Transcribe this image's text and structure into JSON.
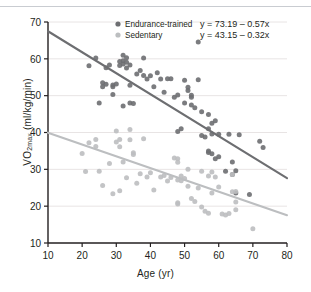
{
  "chart_data": {
    "type": "scatter",
    "title": "",
    "xlabel": "Age (yr)",
    "ylabel": "VO2max (ml/kg/min)",
    "ylabel_main": "VO",
    "ylabel_sub": "2max",
    "ylabel_units": " (ml/kg/min)",
    "xlim": [
      10,
      80
    ],
    "ylim": [
      10,
      70
    ],
    "xticks": [
      10,
      20,
      30,
      40,
      50,
      60,
      70,
      80
    ],
    "yticks": [
      10,
      20,
      30,
      40,
      50,
      60,
      70
    ],
    "grid": "horizontal",
    "legend_position": "top-center",
    "colors": {
      "endurance": "#6d6e71",
      "sedentary": "#bcbec0",
      "axis": "#231f20",
      "grid": "#e8e4e4",
      "top_rule": "#c9ccd1"
    },
    "series": [
      {
        "name": "Endurance-trained",
        "color": "#6d6e71",
        "equation": "y = 73.19 – 0.57x",
        "fit_intercept": 73.19,
        "fit_slope": -0.57,
        "points": [
          [
            22,
            58.1
          ],
          [
            24,
            60.2
          ],
          [
            25,
            48.0
          ],
          [
            26,
            52.4
          ],
          [
            26,
            53.5
          ],
          [
            27,
            53.1
          ],
          [
            27,
            57.6
          ],
          [
            28,
            58.3
          ],
          [
            29,
            50.3
          ],
          [
            29,
            52.4
          ],
          [
            29,
            52.9
          ],
          [
            30,
            53.2
          ],
          [
            31,
            59.3
          ],
          [
            31,
            58.2
          ],
          [
            32,
            61.0
          ],
          [
            32,
            59.5
          ],
          [
            32,
            58.6
          ],
          [
            32,
            47.2
          ],
          [
            33,
            57.5
          ],
          [
            33,
            60.3
          ],
          [
            33,
            59.1
          ],
          [
            34,
            58.3
          ],
          [
            34,
            52.8
          ],
          [
            34,
            48.0
          ],
          [
            35,
            47.9
          ],
          [
            36,
            55.9
          ],
          [
            37,
            56.8
          ],
          [
            38,
            60.2
          ],
          [
            38,
            55.5
          ],
          [
            39,
            54.5
          ],
          [
            40,
            55.4
          ],
          [
            41,
            52.4
          ],
          [
            42,
            56.2
          ],
          [
            43,
            54.5
          ],
          [
            44,
            50.9
          ],
          [
            45,
            54.6
          ],
          [
            46,
            54.6
          ],
          [
            47,
            49.6
          ],
          [
            48,
            50.2
          ],
          [
            48,
            40.3
          ],
          [
            49,
            41.0
          ],
          [
            50,
            54.2
          ],
          [
            50,
            48.0
          ],
          [
            51,
            51.4
          ],
          [
            51,
            52.3
          ],
          [
            52,
            49.6
          ],
          [
            52,
            50.1
          ],
          [
            52,
            47.5
          ],
          [
            53,
            46.7
          ],
          [
            54,
            64.6
          ],
          [
            54,
            54.3
          ],
          [
            55,
            45.6
          ],
          [
            55,
            39.2
          ],
          [
            56,
            38.8
          ],
          [
            57,
            44.9
          ],
          [
            57,
            41.0
          ],
          [
            57,
            34.6
          ],
          [
            57,
            35.0
          ],
          [
            58,
            42.5
          ],
          [
            58,
            34.2
          ],
          [
            58,
            39.6
          ],
          [
            59,
            43.2
          ],
          [
            59,
            32.9
          ],
          [
            60,
            39.5
          ],
          [
            60,
            33.4
          ],
          [
            62,
            29.5
          ],
          [
            63,
            39.5
          ],
          [
            64,
            28.6
          ],
          [
            64,
            32.0
          ],
          [
            65,
            29.6
          ],
          [
            65,
            23.6
          ],
          [
            66,
            39.4
          ],
          [
            69,
            23.2
          ],
          [
            72,
            37.6
          ],
          [
            73,
            35.9
          ]
        ]
      },
      {
        "name": "Sedentary",
        "color": "#bcbec0",
        "equation": "y = 43.15 – 0.32x",
        "fit_intercept": 43.15,
        "fit_slope": -0.32,
        "points": [
          [
            20,
            34.3
          ],
          [
            21,
            29.4
          ],
          [
            22,
            37.2
          ],
          [
            24,
            38.1
          ],
          [
            24,
            36.2
          ],
          [
            25,
            29.5
          ],
          [
            26,
            25.6
          ],
          [
            28,
            31.6
          ],
          [
            29,
            23.4
          ],
          [
            30,
            40.4
          ],
          [
            30,
            37.4
          ],
          [
            31,
            38.1
          ],
          [
            31,
            36.1
          ],
          [
            31,
            24.2
          ],
          [
            32,
            32.0
          ],
          [
            33,
            27.7
          ],
          [
            34,
            38.0
          ],
          [
            34,
            40.8
          ],
          [
            35,
            34.5
          ],
          [
            35,
            34.0
          ],
          [
            36,
            26.2
          ],
          [
            37,
            28.8
          ],
          [
            38,
            38.3
          ],
          [
            39,
            27.9
          ],
          [
            40,
            29.1
          ],
          [
            41,
            24.4
          ],
          [
            43,
            27.9
          ],
          [
            44,
            28.3
          ],
          [
            45,
            26.8
          ],
          [
            46,
            27.8
          ],
          [
            47,
            33.1
          ],
          [
            48,
            32.9
          ],
          [
            48,
            31.9
          ],
          [
            48,
            27.1
          ],
          [
            48,
            20.9
          ],
          [
            48,
            20.6
          ],
          [
            49,
            28.2
          ],
          [
            49,
            26.9
          ],
          [
            50,
            27.5
          ],
          [
            51,
            30.0
          ],
          [
            51,
            25.4
          ],
          [
            52,
            22.1
          ],
          [
            53,
            21.3
          ],
          [
            54,
            24.9
          ],
          [
            55,
            29.5
          ],
          [
            55,
            19.8
          ],
          [
            56,
            18.6
          ],
          [
            57,
            28.2
          ],
          [
            57,
            18.1
          ],
          [
            58,
            23.6
          ],
          [
            58,
            29.3
          ],
          [
            59,
            27.9
          ],
          [
            60,
            25.2
          ],
          [
            61,
            17.9
          ],
          [
            62,
            17.6
          ],
          [
            63,
            18.0
          ],
          [
            64,
            28.6
          ],
          [
            64,
            23.9
          ],
          [
            65,
            21.1
          ],
          [
            65,
            19.0
          ],
          [
            65,
            24.0
          ],
          [
            70,
            13.9
          ]
        ]
      }
    ]
  }
}
